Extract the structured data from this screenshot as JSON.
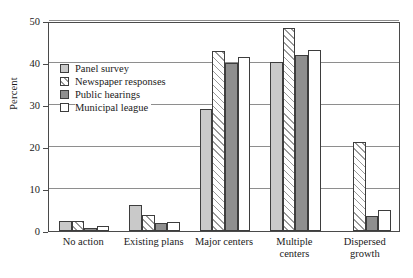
{
  "chart_data": {
    "type": "bar",
    "title": "",
    "xlabel": "",
    "ylabel": "Percent",
    "ylim": [
      0,
      50
    ],
    "yticks": [
      0,
      10,
      20,
      30,
      40,
      50
    ],
    "grid": true,
    "legend_position": "upper-left-inside",
    "categories": [
      "No action",
      "Existing plans",
      "Major centers",
      "Multiple centers",
      "Dispersed growth"
    ],
    "category_lines": [
      [
        "No action"
      ],
      [
        "Existing plans"
      ],
      [
        "Major centers"
      ],
      [
        "Multiple",
        "centers"
      ],
      [
        "Dispersed",
        "growth"
      ]
    ],
    "series": [
      {
        "name": "Panel survey",
        "fill": "solid-light-gray",
        "color": "#c9c9c9",
        "values": [
          2.3,
          6.3,
          29.0,
          40.3,
          0.0
        ]
      },
      {
        "name": "Newspaper responses",
        "fill": "diagonal-hatch",
        "color": "#ffffff",
        "values": [
          2.3,
          3.8,
          42.8,
          48.3,
          21.2
        ]
      },
      {
        "name": "Public hearings",
        "fill": "solid-dark-gray",
        "color": "#8f8f8f",
        "values": [
          0.8,
          1.8,
          40.0,
          42.0,
          3.5
        ]
      },
      {
        "name": "Municipal league",
        "fill": "solid-white",
        "color": "#ffffff",
        "values": [
          1.2,
          2.2,
          41.5,
          43.0,
          5.0
        ]
      }
    ]
  },
  "axis": {
    "y_title": "Percent"
  }
}
